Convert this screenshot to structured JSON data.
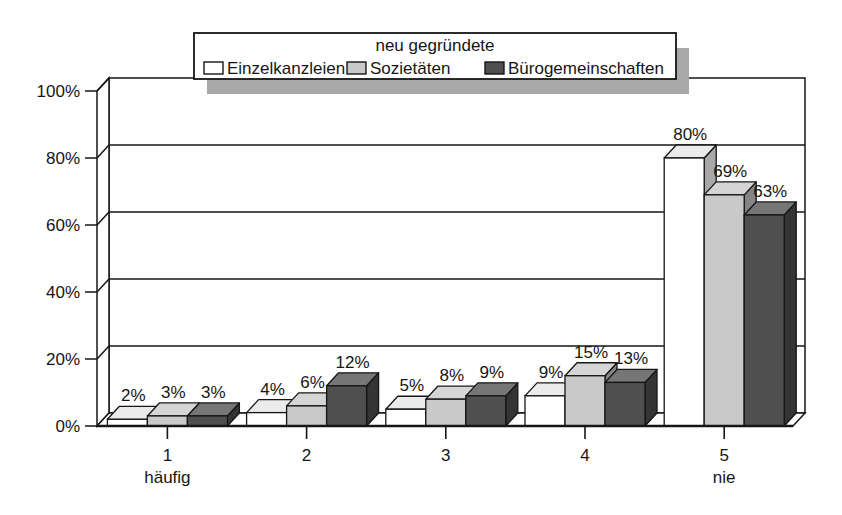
{
  "figure": {
    "background": "#ffffff",
    "axis_color": "#161616"
  },
  "chart_data": {
    "type": "bar",
    "style": "3d-column",
    "title": "",
    "legend_title": "neu gegründete",
    "legend_position": "top",
    "grid": true,
    "categories": [
      "1",
      "2",
      "3",
      "4",
      "5"
    ],
    "category_sublabels": [
      "häufig",
      "",
      "",
      "",
      "nie"
    ],
    "series": [
      {
        "name": "Einzelkanzleien",
        "color": "#ffffff",
        "values": [
          2,
          4,
          5,
          9,
          80
        ]
      },
      {
        "name": "Sozietäten",
        "color": "#c9c9c9",
        "values": [
          3,
          6,
          8,
          15,
          69
        ]
      },
      {
        "name": "Bürogemeinschaften",
        "color": "#4f4f4f",
        "values": [
          3,
          12,
          9,
          13,
          63
        ]
      }
    ],
    "data_label_format": "{v}%",
    "xlabel": "",
    "ylabel": "",
    "ylim": [
      0,
      100
    ],
    "yticks": [
      0,
      20,
      40,
      60,
      80,
      100
    ],
    "ytick_format": "{v}%",
    "shadow_color": "#a8a8a8"
  }
}
